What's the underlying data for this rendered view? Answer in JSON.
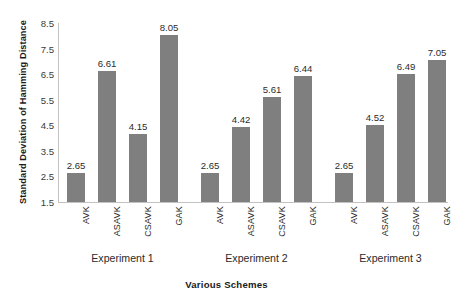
{
  "chart_data": {
    "type": "bar",
    "title": "",
    "xlabel": "Various Schemes",
    "ylabel": "Standard Deviation of Hamming Distance",
    "ylim": [
      1.5,
      8.5
    ],
    "ytick_step": 1.0,
    "yticks": [
      "8.5",
      "7.5",
      "6.5",
      "5.5",
      "4.5",
      "3.5",
      "2.5",
      "1.5"
    ],
    "ytick_values": [
      8.5,
      7.5,
      6.5,
      5.5,
      4.5,
      3.5,
      2.5,
      1.5
    ],
    "grid": false,
    "legend": false,
    "bar_color": "#7f7f7f",
    "axis_color": "#c2c2c2",
    "categories": [
      "AVK",
      "ASAVK",
      "CSAVK",
      "GAK"
    ],
    "groups": [
      {
        "label": "Experiment 1",
        "bars": [
          {
            "category": "AVK",
            "value": 2.65,
            "label": "2.65"
          },
          {
            "category": "ASAVK",
            "value": 6.61,
            "label": "6.61"
          },
          {
            "category": "CSAVK",
            "value": 4.15,
            "label": "4.15"
          },
          {
            "category": "GAK",
            "value": 8.05,
            "label": "8.05"
          }
        ]
      },
      {
        "label": "Experiment 2",
        "bars": [
          {
            "category": "AVK",
            "value": 2.65,
            "label": "2.65"
          },
          {
            "category": "ASAVK",
            "value": 4.42,
            "label": "4.42"
          },
          {
            "category": "CSAVK",
            "value": 5.61,
            "label": "5.61"
          },
          {
            "category": "GAK",
            "value": 6.44,
            "label": "6.44"
          }
        ]
      },
      {
        "label": "Experiment 3",
        "bars": [
          {
            "category": "AVK",
            "value": 2.65,
            "label": "2.65"
          },
          {
            "category": "ASAVK",
            "value": 4.52,
            "label": "4.52"
          },
          {
            "category": "CSAVK",
            "value": 6.49,
            "label": "6.49"
          },
          {
            "category": "GAK",
            "value": 7.05,
            "label": "7.05"
          }
        ]
      }
    ]
  }
}
